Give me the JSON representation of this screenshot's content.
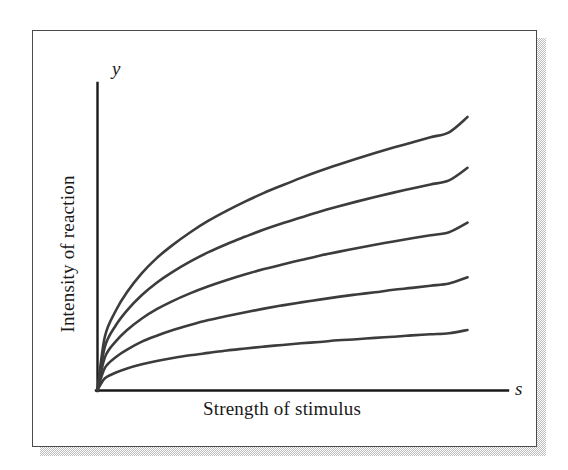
{
  "figure": {
    "frame": {
      "border_color": "#4a4a4a",
      "background_color": "#ffffff",
      "shadow_color": "#b9b9b9"
    }
  },
  "axes": {
    "y_variable": "y",
    "x_variable": "s",
    "x_title": "Strength of stimulus",
    "y_title": "Intensity of reaction",
    "axis_color": "#1a1a1a"
  },
  "chart_data": {
    "type": "line",
    "title": "",
    "subtitle": "",
    "xlabel": "Strength of stimulus",
    "ylabel": "Intensity of reaction",
    "x_axis_variable": "s",
    "y_axis_variable": "y",
    "xlim": [
      0,
      1
    ],
    "ylim": [
      0,
      1
    ],
    "grid": false,
    "legend": false,
    "legend_position": "none",
    "tick_labels_x": [],
    "tick_labels_y": [],
    "annotations": [],
    "curve_color": "#3c3c3c",
    "curve_width": 2.6,
    "x": [
      0,
      0.02,
      0.05,
      0.08,
      0.12,
      0.16,
      0.2,
      0.25,
      0.3,
      0.35,
      0.4,
      0.45,
      0.5,
      0.55,
      0.6,
      0.65,
      0.7,
      0.75,
      0.8,
      0.85,
      0.9,
      0.95,
      1
    ],
    "series": [
      {
        "name": "curve-1",
        "exponent": 0.42,
        "scale": 1.0,
        "values": [
          0,
          0.196,
          0.292,
          0.359,
          0.428,
          0.483,
          0.528,
          0.577,
          0.62,
          0.657,
          0.691,
          0.722,
          0.75,
          0.777,
          0.802,
          0.825,
          0.847,
          0.868,
          0.888,
          0.907,
          0.926,
          0.944,
          1.0
        ]
      },
      {
        "name": "curve-2",
        "exponent": 0.42,
        "scale": 0.814,
        "values": [
          0,
          0.159,
          0.238,
          0.292,
          0.348,
          0.393,
          0.43,
          0.47,
          0.505,
          0.535,
          0.562,
          0.588,
          0.611,
          0.632,
          0.653,
          0.672,
          0.69,
          0.707,
          0.723,
          0.738,
          0.753,
          0.768,
          0.814
        ]
      },
      {
        "name": "curve-3",
        "exponent": 0.42,
        "scale": 0.613,
        "values": [
          0,
          0.12,
          0.179,
          0.22,
          0.262,
          0.296,
          0.324,
          0.354,
          0.38,
          0.403,
          0.424,
          0.443,
          0.46,
          0.476,
          0.492,
          0.506,
          0.519,
          0.532,
          0.544,
          0.556,
          0.567,
          0.578,
          0.613
        ]
      },
      {
        "name": "curve-4",
        "exponent": 0.42,
        "scale": 0.413,
        "values": [
          0,
          0.081,
          0.121,
          0.148,
          0.177,
          0.199,
          0.218,
          0.238,
          0.256,
          0.271,
          0.285,
          0.298,
          0.31,
          0.321,
          0.331,
          0.341,
          0.35,
          0.358,
          0.367,
          0.374,
          0.382,
          0.39,
          0.413
        ]
      },
      {
        "name": "curve-5",
        "exponent": 0.42,
        "scale": 0.22,
        "values": [
          0,
          0.043,
          0.064,
          0.079,
          0.094,
          0.106,
          0.116,
          0.127,
          0.136,
          0.145,
          0.152,
          0.159,
          0.165,
          0.171,
          0.176,
          0.182,
          0.186,
          0.191,
          0.195,
          0.2,
          0.204,
          0.208,
          0.22
        ]
      }
    ]
  }
}
